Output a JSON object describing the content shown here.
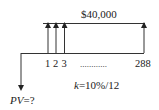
{
  "diagram": {
    "type": "cash-flow-timeline",
    "payment_label": "$40,000",
    "periods": [
      "1",
      "2",
      "3",
      "288"
    ],
    "ellipsis": "............",
    "rate_label_k": "k",
    "rate_label_rest": "=10%/12",
    "pv_label_pv": "PV",
    "pv_label_rest": "=?",
    "colors": {
      "line": "#333333",
      "text": "#222222",
      "background": "#ffffff"
    }
  }
}
